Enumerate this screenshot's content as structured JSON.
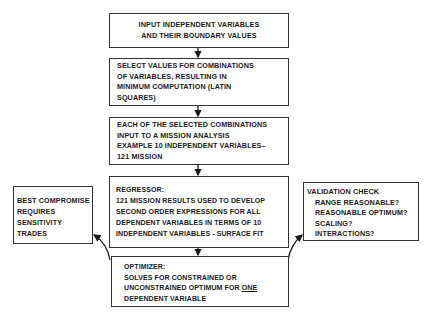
{
  "diagram": {
    "type": "flowchart",
    "nodes": [
      {
        "id": "input",
        "lines": [
          "INPUT INDEPENDENT VARIABLES",
          "AND THEIR BOUNDARY VALUES"
        ]
      },
      {
        "id": "select",
        "lines": [
          "SELECT VALUES FOR COMBINATIONS",
          "OF VARIABLES, RESULTING IN",
          "MINIMUM COMPUTATION (LATIN",
          "SQUARES)"
        ]
      },
      {
        "id": "mission",
        "lines": [
          "EACH OF THE SELECTED COMBINATIONS",
          "INPUT TO A MISSION ANALYSIS",
          "EXAMPLE 10 INDEPENDENT VARIABLES–",
          "121 MISSION"
        ]
      },
      {
        "id": "regressor",
        "lines": [
          "REGRESSOR:",
          "121 MISSION RESULTS USED TO DEVELOP",
          "SECOND ORDER EXPRESSIONS FOR ALL",
          "DEPENDENT VARIABLES IN TERMS OF 10",
          "INDEPENDENT VARIABLES - SURFACE FIT"
        ]
      },
      {
        "id": "optimizer",
        "lines": [
          "OPTIMIZER:",
          "SOLVES FOR CONSTRAINED OR",
          "UNCONSTRAINED OPTIMUM FOR ",
          "DEPENDENT VARIABLE"
        ],
        "underlined_word": "ONE"
      },
      {
        "id": "compromise",
        "lines": [
          "BEST COMPROMISE",
          "REQUIRES",
          "SENSITIVITY",
          "TRADES"
        ]
      },
      {
        "id": "validation",
        "lines": [
          "VALIDATION CHECK",
          "RANGE REASONABLE?",
          "REASONABLE OPTIMUM?",
          "SCALING?",
          "INTERACTIONS?"
        ]
      }
    ],
    "edges": [
      {
        "from": "input",
        "to": "select"
      },
      {
        "from": "select",
        "to": "mission"
      },
      {
        "from": "mission",
        "to": "regressor"
      },
      {
        "from": "regressor",
        "to": "optimizer"
      },
      {
        "from": "optimizer",
        "to": "compromise"
      },
      {
        "from": "optimizer",
        "to": "validation"
      }
    ]
  }
}
